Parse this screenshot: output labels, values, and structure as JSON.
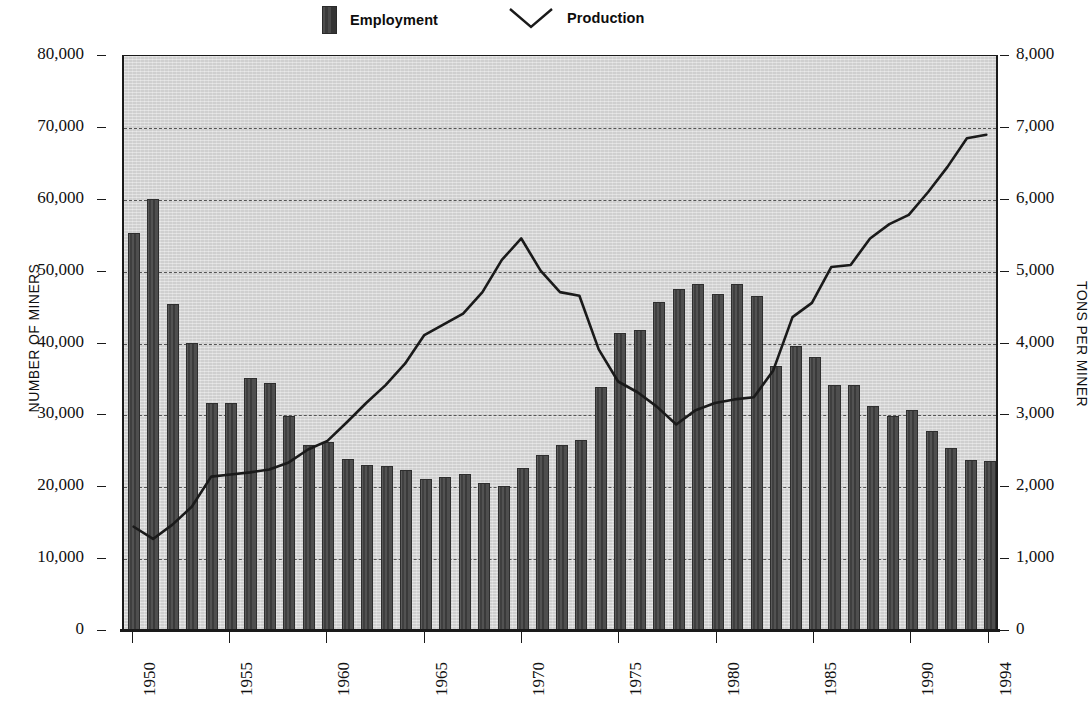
{
  "legend": {
    "employment": {
      "label": "Employment",
      "swatch": "bar-swatch",
      "color": "#3b3b3b"
    },
    "production": {
      "label": "Production",
      "swatch": "vee-line-swatch",
      "color": "#1a1a1a"
    }
  },
  "axes": {
    "left_title": "NUMBER OF MINERS",
    "right_title": "TONS PER MINER",
    "left_ticks": [
      "80,000",
      "70,000",
      "60,000",
      "50,000",
      "40,000",
      "30,000",
      "20,000",
      "10,000",
      "0"
    ],
    "right_ticks": [
      "8,000",
      "7,000",
      "6,000",
      "5,000",
      "4,000",
      "3,000",
      "2,000",
      "1,000",
      "0"
    ],
    "x_ticks": [
      "1950",
      "1955",
      "1960",
      "1965",
      "1970",
      "1975",
      "1980",
      "1985",
      "1990",
      "1994"
    ]
  },
  "chart_data": {
    "type": "bar",
    "title": "",
    "xlabel": "",
    "ylabel": "NUMBER OF MINERS",
    "y2label": "TONS PER MINER",
    "ylim": [
      0,
      80000
    ],
    "y2lim": [
      0,
      8000
    ],
    "grid": true,
    "legend_position": "top",
    "x": [
      1950,
      1951,
      1952,
      1953,
      1954,
      1955,
      1956,
      1957,
      1958,
      1959,
      1960,
      1961,
      1962,
      1963,
      1964,
      1965,
      1966,
      1967,
      1968,
      1969,
      1970,
      1971,
      1972,
      1973,
      1974,
      1975,
      1976,
      1977,
      1978,
      1979,
      1980,
      1981,
      1982,
      1983,
      1984,
      1985,
      1986,
      1987,
      1988,
      1989,
      1990,
      1991,
      1992,
      1993,
      1994
    ],
    "series": [
      {
        "name": "Employment",
        "type": "bar",
        "axis": "left",
        "unit": "miners",
        "color": "#4a4a4a",
        "values": [
          55200,
          60000,
          45400,
          40000,
          31600,
          31600,
          35000,
          34300,
          29800,
          25700,
          26200,
          23800,
          23000,
          22800,
          22200,
          21000,
          21300,
          21700,
          20500,
          20000,
          22500,
          24400,
          25800,
          26400,
          33800,
          41300,
          41700,
          45700,
          47400,
          48200,
          46800,
          48200,
          46500,
          36800,
          39500,
          38000,
          34100,
          34100,
          31100,
          29800,
          30600,
          27700,
          25300,
          23600,
          23500
        ]
      },
      {
        "name": "Production",
        "type": "line",
        "axis": "right",
        "unit": "tons per miner",
        "color": "#1a1a1a",
        "values": [
          1420,
          1250,
          1450,
          1700,
          2120,
          2150,
          2180,
          2220,
          2320,
          2500,
          2620,
          2880,
          3150,
          3400,
          3700,
          4100,
          4250,
          4400,
          4700,
          5150,
          5450,
          5000,
          4700,
          4650,
          3900,
          3450,
          3300,
          3100,
          2850,
          3050,
          3150,
          3200,
          3230,
          3600,
          4350,
          4550,
          5050,
          5080,
          5450,
          5650,
          5780,
          6100,
          6450,
          6850,
          6900
        ]
      }
    ]
  }
}
